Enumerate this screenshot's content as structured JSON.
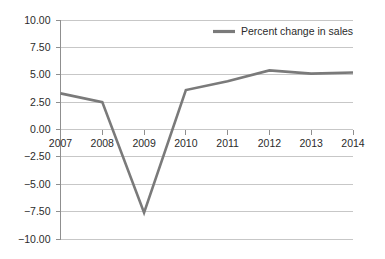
{
  "chart_data": {
    "type": "line",
    "title": "",
    "subtitle": "",
    "xlabel": "",
    "ylabel": "",
    "categories": [
      "2007",
      "2008",
      "2009",
      "2010",
      "2011",
      "2012",
      "2013",
      "2014"
    ],
    "series": [
      {
        "name": "Percent change in sales",
        "color": "#7a7a7a",
        "values": [
          3.3,
          2.5,
          -7.6,
          3.6,
          4.4,
          5.4,
          5.1,
          5.2
        ]
      }
    ],
    "ylim": [
      -10.0,
      10.0
    ],
    "y_ticks": [
      10.0,
      7.5,
      5.0,
      2.5,
      0.0,
      -2.5,
      -5.0,
      -7.5,
      -10.0
    ],
    "y_tick_labels": [
      "10.00",
      "7.50",
      "5.00",
      "2.50",
      "0.00",
      "−2.50",
      "−5.00",
      "−7.50",
      "−10.00"
    ],
    "x_tick_labels": [
      "2007",
      "2008",
      "2009",
      "2010",
      "2011",
      "2012",
      "2013",
      "2014"
    ],
    "grid": true,
    "legend_position": "top-right",
    "legend_entries": [
      "Percent change in sales"
    ],
    "zero_baseline": 0.0,
    "background_color": "#ffffff",
    "grid_color": "#b9b9b9"
  },
  "legend": {
    "entry_label": "Percent change in sales"
  }
}
